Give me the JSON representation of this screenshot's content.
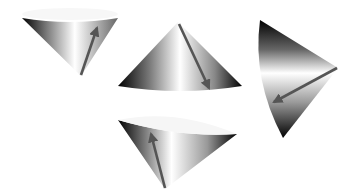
{
  "figure": {
    "background": "#ffffff",
    "arrow_color": "#555555",
    "cones": [
      {
        "id": "cone-top-left",
        "orientation": "apex-down, rim tilted toward viewer"
      },
      {
        "id": "cone-center",
        "orientation": "apex-up"
      },
      {
        "id": "cone-right",
        "orientation": "apex-right"
      },
      {
        "id": "cone-bottom",
        "orientation": "apex-down"
      }
    ]
  }
}
